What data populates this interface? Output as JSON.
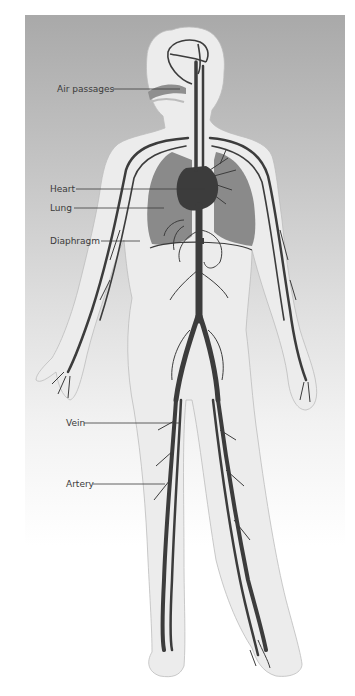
{
  "figure": {
    "colors": {
      "background_top": "#a9a9a9",
      "background_bottom": "#ffffff",
      "body_fill": "#ececec",
      "vessels": "#3c3c3c",
      "lungs": "#8a8a8a",
      "leader_lines": "#3a3a3a"
    },
    "labels": [
      {
        "id": "air-passages",
        "text": "Air passages",
        "x": 57,
        "y": 84,
        "line_to_x": 180,
        "line_y": 89
      },
      {
        "id": "heart",
        "text": "Heart",
        "x": 50,
        "y": 184,
        "line_to_x": 205,
        "line_y": 189
      },
      {
        "id": "lung",
        "text": "Lung",
        "x": 50,
        "y": 203,
        "line_to_x": 164,
        "line_y": 208
      },
      {
        "id": "diaphragm",
        "text": "Diaphragm",
        "x": 50,
        "y": 237,
        "line_to_x": 140,
        "line_y": 241
      },
      {
        "id": "vein",
        "text": "Vein",
        "x": 66,
        "y": 418,
        "line_to_x": 180,
        "line_y": 423
      },
      {
        "id": "artery",
        "text": "Artery",
        "x": 66,
        "y": 479,
        "line_to_x": 165,
        "line_y": 484
      }
    ]
  }
}
